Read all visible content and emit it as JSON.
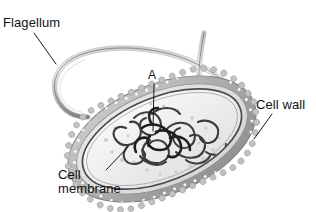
{
  "figure": {
    "background_color": "#ffffff",
    "label_color": "#111111",
    "leader_line_color": "#1a1a1a"
  },
  "labels": {
    "flagellum": "Flagellum",
    "pointer_a": "A",
    "cell_wall": "Cell wall",
    "cell_membrane_line1": "Cell",
    "cell_membrane_line2": "membrane"
  },
  "structures": {
    "flagellum": {
      "name": "flagellum",
      "description": "long whip-like tail curving up from the left pole and hooking back on the right",
      "color_light": "#d8d8d8",
      "color_dark": "#6f6f6f"
    },
    "cell_wall": {
      "name": "cell-wall",
      "description": "bumpy granular outer envelope with pale speckles",
      "color": "#b4b4b4",
      "speckle_color": "#f4f4f4"
    },
    "periplasm": {
      "name": "periplasmic-space",
      "color": "#e9e9e9"
    },
    "cell_membrane": {
      "name": "cell-membrane",
      "description": "dark inner boundary line inside the cell wall",
      "color": "#4a4a4a"
    },
    "cytoplasm": {
      "name": "cytoplasm",
      "color": "#f6f6f6",
      "ribosome_color": "#c9c9c9"
    },
    "nucleoid": {
      "name": "nucleoid-dna",
      "description": "tangled looping chromosome mass at the cell centre, the part marked A",
      "color": "#3a3a3a"
    }
  },
  "leaders": {
    "flagellum": {
      "from": [
        34,
        33
      ],
      "to": [
        56,
        64
      ]
    },
    "pointer_a": {
      "from": [
        154,
        84
      ],
      "to": [
        153,
        131
      ]
    },
    "cell_wall": {
      "from": [
        272,
        114
      ],
      "to": [
        254,
        139
      ]
    },
    "cell_membrane": {
      "from": [
        106,
        170
      ],
      "to": [
        128,
        147
      ]
    }
  }
}
